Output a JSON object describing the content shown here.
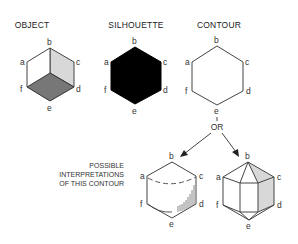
{
  "titles": {
    "object": "OBJECT",
    "silhouette": "SILHOUETTE",
    "contour": "CONTOUR"
  },
  "vertex_labels": [
    "a",
    "b",
    "c",
    "d",
    "e",
    "f"
  ],
  "connector": "OR",
  "caption": {
    "line1": "POSSIBLE",
    "line2": "INTERPRETATIONS",
    "line3": "OF THIS CONTOUR"
  },
  "colors": {
    "line": "#444444",
    "silhouette_fill": "#000000",
    "light_shade": "#d8d8d8",
    "dark_shade": "#777777"
  }
}
